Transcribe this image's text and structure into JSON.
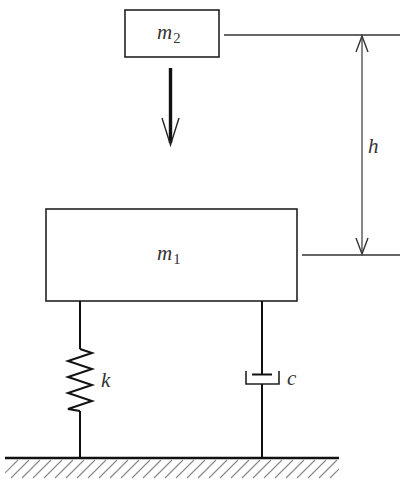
{
  "diagram": {
    "type": "mass-spring-damper impact system",
    "colors": {
      "stroke": "#222222",
      "hatch": "#777777",
      "background": "#ffffff",
      "text": "#333333"
    },
    "mass_top": {
      "symbol": "m",
      "subscript": "2"
    },
    "mass_bottom": {
      "symbol": "m",
      "subscript": "1"
    },
    "drop_height": {
      "symbol": "h"
    },
    "spring": {
      "symbol": "k"
    },
    "damper": {
      "symbol": "c"
    },
    "fall_arrow": {
      "direction": "down"
    },
    "ground": {
      "style": "hatched"
    }
  }
}
